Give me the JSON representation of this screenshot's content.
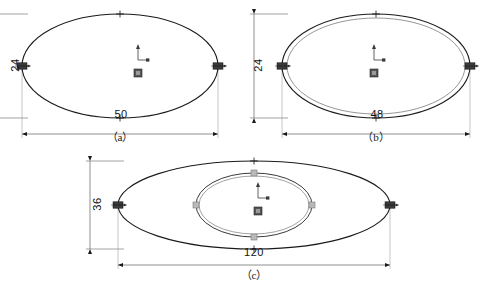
{
  "document": {
    "type": "cad-technical-drawing",
    "background_color": "#ffffff",
    "line_color": "#1a1a1a",
    "grip_color": "#3a3a3a",
    "secondary_color": "#8a8a8a"
  },
  "figures": [
    {
      "id": "a",
      "caption": "（a）",
      "width_dim": "50",
      "height_dim": "24",
      "ellipses": [
        {
          "cx": 120,
          "cy": 66,
          "rx": 98,
          "ry": 52,
          "stroke": "#1a1a1a",
          "width": 1.1
        }
      ],
      "grips": [
        {
          "x": 22,
          "y": 66,
          "kind": "filled-square"
        },
        {
          "x": 218,
          "y": 66,
          "kind": "filled-square"
        },
        {
          "x": 120,
          "y": 14,
          "kind": "small-cross"
        },
        {
          "x": 120,
          "y": 118,
          "kind": "small-cross"
        }
      ],
      "ucs": {
        "x": 138,
        "y": 60
      },
      "center_marker": {
        "x": 138,
        "y": 73
      }
    },
    {
      "id": "b",
      "caption": "（b）",
      "width_dim": "48",
      "height_dim": "24",
      "ellipses": [
        {
          "cx": 376,
          "cy": 66,
          "rx": 94,
          "ry": 52,
          "stroke": "#1a1a1a",
          "width": 1.1
        },
        {
          "cx": 376,
          "cy": 66,
          "rx": 89,
          "ry": 48,
          "stroke": "#8a8a8a",
          "width": 0.9
        }
      ],
      "grips": [
        {
          "x": 282,
          "y": 66,
          "kind": "filled-square"
        },
        {
          "x": 470,
          "y": 66,
          "kind": "filled-square"
        },
        {
          "x": 376,
          "y": 14,
          "kind": "small-cross"
        },
        {
          "x": 376,
          "y": 118,
          "kind": "small-cross"
        }
      ],
      "ucs": {
        "x": 374,
        "y": 60
      },
      "center_marker": {
        "x": 374,
        "y": 73
      }
    },
    {
      "id": "c",
      "caption": "（c）",
      "width_dim": "120",
      "height_dim": "36",
      "ellipses": [
        {
          "cx": 254,
          "cy": 205,
          "rx": 136,
          "ry": 44,
          "stroke": "#1a1a1a",
          "width": 1.1
        },
        {
          "cx": 254,
          "cy": 205,
          "rx": 58,
          "ry": 32,
          "stroke": "#3a3a3a",
          "width": 1.0
        },
        {
          "cx": 254,
          "cy": 205,
          "rx": 55,
          "ry": 29,
          "stroke": "#8a8a8a",
          "width": 0.8
        }
      ],
      "grips": [
        {
          "x": 118,
          "y": 205,
          "kind": "filled-square"
        },
        {
          "x": 390,
          "y": 205,
          "kind": "filled-square"
        },
        {
          "x": 254,
          "y": 161,
          "kind": "small-cross"
        },
        {
          "x": 254,
          "y": 249,
          "kind": "small-cross"
        },
        {
          "x": 196,
          "y": 205,
          "kind": "grey-square"
        },
        {
          "x": 312,
          "y": 205,
          "kind": "grey-square"
        },
        {
          "x": 254,
          "y": 173,
          "kind": "grey-square"
        },
        {
          "x": 254,
          "y": 237,
          "kind": "grey-square"
        }
      ],
      "ucs": {
        "x": 258,
        "y": 198
      },
      "center_marker": {
        "x": 258,
        "y": 211
      }
    }
  ],
  "dimensions": [
    {
      "figure": "a",
      "axis": "vertical",
      "value": "24",
      "text_x": 14,
      "text_y": 66
    },
    {
      "figure": "a",
      "axis": "horizontal",
      "value": "50",
      "text_x": 120,
      "text_y": 118
    },
    {
      "figure": "b",
      "axis": "vertical",
      "value": "24",
      "text_x": 257,
      "text_y": 66
    },
    {
      "figure": "b",
      "axis": "horizontal",
      "value": "48",
      "text_x": 376,
      "text_y": 118
    },
    {
      "figure": "c",
      "axis": "vertical",
      "value": "36",
      "text_x": 96,
      "text_y": 205
    },
    {
      "figure": "c",
      "axis": "horizontal",
      "value": "120",
      "text_x": 254,
      "text_y": 256
    }
  ],
  "captions": {
    "a": "（a）",
    "b": "（b）",
    "c": "（c）",
    "bottom": ""
  },
  "icons": {
    "ucs": "ucs-axis-icon",
    "grip": "grip-square-icon",
    "arrow": "dimension-arrow-icon"
  }
}
